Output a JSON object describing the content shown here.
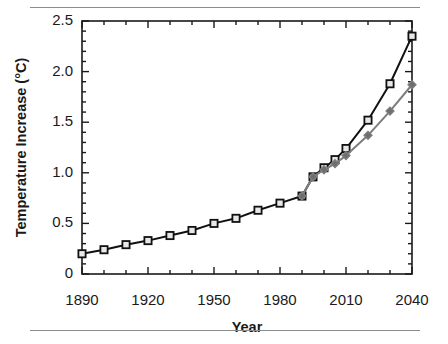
{
  "figure": {
    "background_color": "#ffffff",
    "rule_color": "#8c8c8c",
    "top_rule_name": "top-divider",
    "bottom_rule_name": "bottom-divider"
  },
  "chart_data": {
    "type": "line",
    "title": "",
    "xlabel": "Year",
    "ylabel": "Temperature Increase (°C)",
    "xlim": [
      1890,
      2040
    ],
    "ylim": [
      0,
      2.5
    ],
    "grid": false,
    "legend": "none",
    "x_major_ticks": [
      1890,
      1920,
      1950,
      1980,
      2010,
      2040
    ],
    "x_major_tick_labels": [
      "1890",
      "1920",
      "1950",
      "1980",
      "2010",
      "2040"
    ],
    "x_minor_tick_step": 10,
    "y_major_ticks": [
      0,
      0.5,
      1.0,
      1.5,
      2.0,
      2.5
    ],
    "y_major_tick_labels": [
      "0",
      "0.5",
      "1.0",
      "1.5",
      "2.0",
      "2.5"
    ],
    "y_minor_tick_step": 0.1,
    "axis_color": "#1a1a1a",
    "series": [
      {
        "name": "high-scenario",
        "color": "#111111",
        "marker": "open-square",
        "marker_face_color": "#e8e8e8",
        "line_width": 2.0,
        "x": [
          1890,
          1900,
          1910,
          1920,
          1930,
          1940,
          1950,
          1960,
          1970,
          1980,
          1990,
          1995,
          2000,
          2005,
          2010,
          2020,
          2030,
          2040
        ],
        "values": [
          0.2,
          0.24,
          0.29,
          0.33,
          0.38,
          0.43,
          0.5,
          0.55,
          0.63,
          0.7,
          0.77,
          0.96,
          1.05,
          1.13,
          1.24,
          1.52,
          1.88,
          2.35
        ]
      },
      {
        "name": "low-scenario",
        "color": "#7d7d7d",
        "marker": "filled-diamond",
        "marker_face_color": "#6e6e6e",
        "line_width": 2.0,
        "x": [
          1990,
          1995,
          2000,
          2005,
          2010,
          2020,
          2030,
          2040
        ],
        "values": [
          0.77,
          0.96,
          1.03,
          1.09,
          1.17,
          1.37,
          1.61,
          1.87
        ]
      }
    ]
  }
}
